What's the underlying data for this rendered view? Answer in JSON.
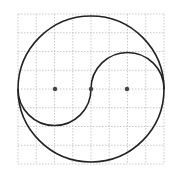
{
  "diagram": {
    "type": "yin-yang construction on grid",
    "grid": {
      "x0": 18,
      "y0": 14,
      "cols": 8,
      "rows": 8,
      "cell_w": 18.25,
      "cell_h": 18.75,
      "color": "#bdbdbd"
    },
    "big_circle": {
      "cx": 91,
      "cy": 89,
      "r": 73
    },
    "s_curve": {
      "upper_arc_center": [
        127,
        89
      ],
      "upper_arc_r": 36,
      "lower_arc_center": [
        55,
        89
      ],
      "lower_arc_r": 36
    },
    "points": [
      {
        "label": "left-center",
        "x": 55,
        "y": 89
      },
      {
        "label": "center",
        "x": 91,
        "y": 89
      },
      {
        "label": "right-center",
        "x": 127,
        "y": 89
      }
    ],
    "stroke_color": "#222222",
    "point_color": "#444444"
  }
}
